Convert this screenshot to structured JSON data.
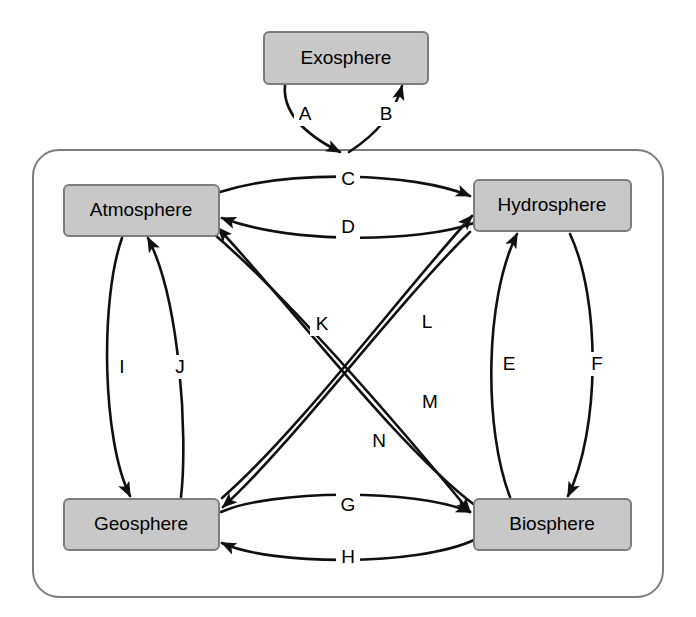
{
  "diagram": {
    "type": "node-link-diagram",
    "canvas": {
      "width": 696,
      "height": 617,
      "background": "#ffffff"
    },
    "style": {
      "node_fill": "#c8c8c8",
      "node_stroke": "#7d7d7d",
      "edge_color": "#101010",
      "container_stroke": "#7d7d7d",
      "text_color": "#000000"
    },
    "container": {
      "name": "earth-system-boundary",
      "shape": "rounded-rectangle",
      "x": 33,
      "y": 150,
      "width": 630,
      "height": 447,
      "radius": 26
    },
    "nodes": [
      {
        "id": "exosphere",
        "label": "Exosphere",
        "x": 264,
        "y": 32,
        "width": 164,
        "height": 52,
        "inside_container": false
      },
      {
        "id": "atmosphere",
        "label": "Atmosphere",
        "x": 64,
        "y": 185,
        "width": 155,
        "height": 51,
        "inside_container": true
      },
      {
        "id": "hydrosphere",
        "label": "Hydrosphere",
        "x": 474,
        "y": 180,
        "width": 157,
        "height": 51,
        "inside_container": true
      },
      {
        "id": "geosphere",
        "label": "Geosphere",
        "x": 64,
        "y": 499,
        "width": 155,
        "height": 51,
        "inside_container": true
      },
      {
        "id": "biosphere",
        "label": "Biosphere",
        "x": 474,
        "y": 499,
        "width": 157,
        "height": 51,
        "inside_container": true
      }
    ],
    "edges": [
      {
        "id": "A",
        "label": "A",
        "from": "exosphere",
        "to": "earth-system",
        "label_x": 305,
        "label_y": 114
      },
      {
        "id": "B",
        "label": "B",
        "from": "earth-system",
        "to": "exosphere",
        "label_x": 386,
        "label_y": 114
      },
      {
        "id": "C",
        "label": "C",
        "from": "atmosphere",
        "to": "hydrosphere",
        "label_x": 348,
        "label_y": 179
      },
      {
        "id": "D",
        "label": "D",
        "from": "hydrosphere",
        "to": "atmosphere",
        "label_x": 348,
        "label_y": 227
      },
      {
        "id": "E",
        "label": "E",
        "from": "biosphere",
        "to": "hydrosphere",
        "label_x": 509,
        "label_y": 364
      },
      {
        "id": "F",
        "label": "F",
        "from": "hydrosphere",
        "to": "biosphere",
        "label_x": 597,
        "label_y": 364
      },
      {
        "id": "G",
        "label": "G",
        "from": "geosphere",
        "to": "biosphere",
        "label_x": 348,
        "label_y": 505
      },
      {
        "id": "H",
        "label": "H",
        "from": "biosphere",
        "to": "geosphere",
        "label_x": 348,
        "label_y": 557
      },
      {
        "id": "I",
        "label": "I",
        "from": "atmosphere",
        "to": "geosphere",
        "label_x": 122,
        "label_y": 367
      },
      {
        "id": "J",
        "label": "J",
        "from": "geosphere",
        "to": "atmosphere",
        "label_x": 180,
        "label_y": 367
      },
      {
        "id": "K",
        "label": "K",
        "from": "atmosphere",
        "to": "biosphere",
        "label_x": 322,
        "label_y": 324
      },
      {
        "id": "L",
        "label": "L",
        "from": "geosphere",
        "to": "hydrosphere",
        "label_x": 427,
        "label_y": 322
      },
      {
        "id": "M",
        "label": "M",
        "from": "hydrosphere",
        "to": "geosphere",
        "label_x": 430,
        "label_y": 402
      },
      {
        "id": "N",
        "label": "N",
        "from": "biosphere",
        "to": "atmosphere",
        "label_x": 379,
        "label_y": 441
      }
    ]
  }
}
